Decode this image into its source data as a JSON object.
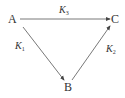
{
  "nodes": {
    "a": "A",
    "b": "B",
    "c": "C"
  },
  "edges": {
    "ac": {
      "label": "K",
      "sub": "3"
    },
    "ab": {
      "label": "K",
      "sub": "1"
    },
    "bc": {
      "label": "K",
      "sub": "2"
    }
  },
  "colors": {
    "line": "#444444"
  }
}
